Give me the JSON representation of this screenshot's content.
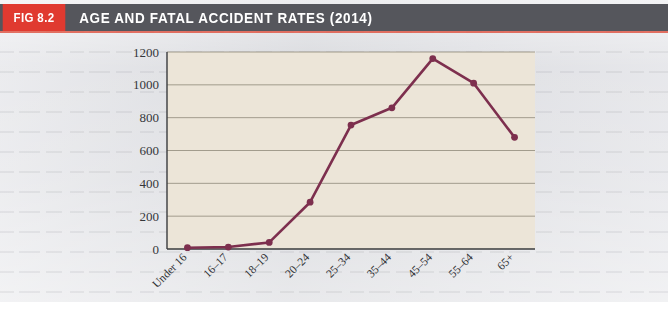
{
  "figure": {
    "badge_label": "FIG 8.2",
    "title": "AGE AND FATAL ACCIDENT RATES (2014)",
    "badge_color": "#e03a30",
    "header_color": "#55565c",
    "plot_background": "#ece5d8",
    "series_color": "#7d2f4e",
    "gridline_color": "#9a9384"
  },
  "chart_data": {
    "type": "line",
    "title": "AGE AND FATAL ACCIDENT RATES (2014)",
    "xlabel": "",
    "ylabel": "",
    "categories": [
      "Under 16",
      "16–17",
      "18–19",
      "20–24",
      "25–34",
      "35–44",
      "45–54",
      "55–64",
      "65+"
    ],
    "values": [
      8,
      12,
      40,
      285,
      755,
      860,
      1160,
      1010,
      680
    ],
    "series": [
      {
        "name": "Fatal accident rate",
        "values": [
          8,
          12,
          40,
          285,
          755,
          860,
          1160,
          1010,
          680
        ]
      }
    ],
    "ylim": [
      0,
      1200
    ],
    "ytick_values": [
      0,
      200,
      400,
      600,
      800,
      1000,
      1200
    ],
    "ytick_labels": [
      "0",
      "200",
      "400",
      "600",
      "800",
      "1000",
      "1200"
    ],
    "grid": true,
    "grid_axis": "y",
    "legend": false,
    "legend_position": "none",
    "markers": true,
    "xtick_rotation": 45
  }
}
